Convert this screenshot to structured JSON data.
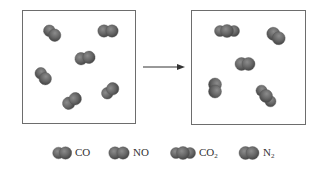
{
  "diagram": {
    "type": "reaction-particle-diagram",
    "arrow": {
      "direction": "right"
    },
    "before_box": {
      "molecules": [
        {
          "species": "CO",
          "x": 52,
          "y": 33,
          "rot": 40
        },
        {
          "species": "NO",
          "x": 108,
          "y": 31,
          "rot": 0
        },
        {
          "species": "NO",
          "x": 85,
          "y": 58,
          "rot": -10
        },
        {
          "species": "CO",
          "x": 43,
          "y": 76,
          "rot": 50
        },
        {
          "species": "NO",
          "x": 72,
          "y": 101,
          "rot": -35
        },
        {
          "species": "CO",
          "x": 110,
          "y": 91,
          "rot": -40
        }
      ]
    },
    "after_box": {
      "molecules": [
        {
          "species": "CO2",
          "x": 227,
          "y": 31,
          "rot": 0
        },
        {
          "species": "N2",
          "x": 276,
          "y": 36,
          "rot": 40
        },
        {
          "species": "N2",
          "x": 245,
          "y": 64,
          "rot": 0
        },
        {
          "species": "N2",
          "x": 215,
          "y": 88,
          "rot": 90
        },
        {
          "species": "CO2",
          "x": 266,
          "y": 96,
          "rot": 50
        }
      ]
    },
    "legend": [
      {
        "species": "CO",
        "label": "CO",
        "sub": ""
      },
      {
        "species": "NO",
        "label": "NO",
        "sub": ""
      },
      {
        "species": "CO2",
        "label": "CO",
        "sub": "2"
      },
      {
        "species": "N2",
        "label": "N",
        "sub": "2"
      }
    ],
    "colors": {
      "atom": "#6a6a6a",
      "atom_dark": "#4a4a4a",
      "highlight": "#9a9a9a",
      "border": "#6d6d6d"
    }
  }
}
